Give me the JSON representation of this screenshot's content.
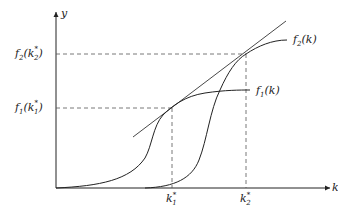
{
  "diagram": {
    "axes": {
      "x_label": "k",
      "y_label": "y"
    },
    "curves": [
      {
        "name": "f2",
        "label_main": "f",
        "label_sub": "2",
        "label_arg": "(k)"
      },
      {
        "name": "f1",
        "label_main": "f",
        "label_sub": "1",
        "label_arg": "(k)"
      }
    ],
    "y_ticks": [
      {
        "main": "f",
        "sub": "2",
        "open": "(k",
        "sup": "*",
        "sub2": "2",
        "close": ")"
      },
      {
        "main": "f",
        "sub": "1",
        "open": "(k",
        "sup": "*",
        "sub2": "1",
        "close": ")"
      }
    ],
    "x_ticks": [
      {
        "main": "k",
        "sup": "*",
        "sub": "1"
      },
      {
        "main": "k",
        "sup": "*",
        "sub": "2"
      }
    ],
    "elements": {
      "tangent_line": "common tangent to f1 and f2",
      "dashed_guides": "projections of tangency points to axes"
    },
    "colors": {
      "line": "#222222",
      "dash": "#555555",
      "background": "#ffffff"
    }
  }
}
